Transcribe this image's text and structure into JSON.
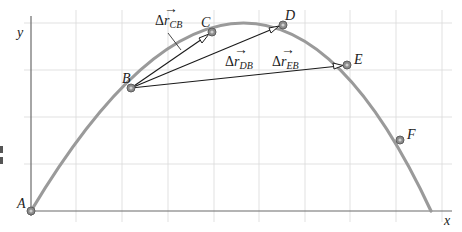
{
  "figure": {
    "type": "projectile-trajectory-displacement-diagram",
    "axes": {
      "x_label": "x",
      "y_label": "y"
    },
    "points": [
      {
        "label": "A",
        "x": 31,
        "y": 211
      },
      {
        "label": "B",
        "x": 131,
        "y": 88
      },
      {
        "label": "C",
        "x": 212,
        "y": 32
      },
      {
        "label": "D",
        "x": 283,
        "y": 25
      },
      {
        "label": "E",
        "x": 347,
        "y": 65
      },
      {
        "label": "F",
        "x": 400,
        "y": 140
      }
    ],
    "vectors": [
      {
        "name": "delta-r-CB",
        "from": "B",
        "to": "C",
        "label_main": "Δr",
        "label_sub": "CB"
      },
      {
        "name": "delta-r-DB",
        "from": "B",
        "to": "D",
        "label_main": "Δr",
        "label_sub": "DB"
      },
      {
        "name": "delta-r-EB",
        "from": "B",
        "to": "E",
        "label_main": "Δr",
        "label_sub": "EB"
      }
    ],
    "grid": {
      "x_lines": [
        31,
        76,
        122,
        168,
        214,
        259,
        305,
        350,
        396,
        442
      ],
      "y_lines": [
        23,
        70,
        117,
        164,
        211
      ]
    },
    "colors": {
      "trajectory": "#9a9a9a",
      "grid": "#d9d9d9",
      "axis": "#6b6b6b",
      "vector": "#1a1a1a"
    }
  },
  "labels": {
    "y_axis": "y",
    "x_axis": "x",
    "A": "A",
    "B": "B",
    "C": "C",
    "D": "D",
    "E": "E",
    "F": "F",
    "delta": "Δ",
    "r": "r",
    "arrow": "⃗",
    "sub_CB": "CB",
    "sub_DB": "DB",
    "sub_EB": "EB"
  }
}
